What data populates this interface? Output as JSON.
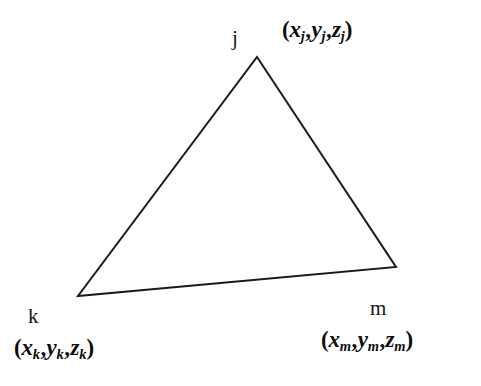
{
  "figure": {
    "type": "geometry-diagram",
    "background_color": "#ffffff",
    "stroke_color": "#1a1a1a",
    "stroke_width": 2
  },
  "triangle": {
    "vertices": [
      {
        "id": "j",
        "x": 257,
        "y": 57
      },
      {
        "id": "m",
        "x": 396,
        "y": 267
      },
      {
        "id": "k",
        "x": 78,
        "y": 296
      }
    ],
    "edges": [
      {
        "from": "j",
        "to": "m"
      },
      {
        "from": "m",
        "to": "k"
      },
      {
        "from": "k",
        "to": "j"
      }
    ]
  },
  "labels": {
    "vertex_j": "j",
    "vertex_k": "k",
    "vertex_m": "m"
  },
  "coordinates": {
    "j": {
      "open": "(",
      "x_var": "x",
      "x_sub": "j",
      "comma1": ",",
      "y_var": "y",
      "y_sub": "j",
      "comma2": ",",
      "z_var": "z",
      "z_sub": "j",
      "close": ")"
    },
    "k": {
      "open": "(",
      "x_var": "x",
      "x_sub": "k",
      "comma1": ",",
      "y_var": "y",
      "y_sub": "k",
      "comma2": ",",
      "z_var": "z",
      "z_sub": "k",
      "close": ")"
    },
    "m": {
      "open": "(",
      "x_var": "x",
      "x_sub": "m",
      "comma1": ",",
      "y_var": "y",
      "y_sub": "m",
      "comma2": ",",
      "z_var": "z",
      "z_sub": "m",
      "close": ")"
    }
  }
}
